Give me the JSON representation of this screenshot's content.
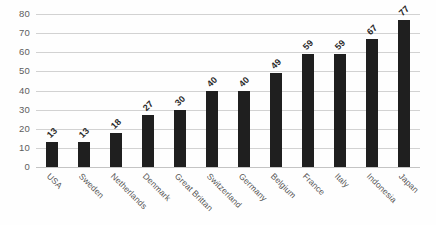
{
  "chart_data": {
    "type": "bar",
    "title": "",
    "subtitle": "",
    "xlabel": "",
    "ylabel": "",
    "ylim": [
      0,
      80
    ],
    "y_ticks": [
      0,
      10,
      20,
      30,
      40,
      50,
      60,
      70,
      80
    ],
    "grid": true,
    "legend": false,
    "legend_position": "none",
    "orientation": "vertical",
    "bar_color": "#1f1f1f",
    "gridline_color": "#d2d2d2",
    "background_color": "#fefefe",
    "data_labels_shown": true,
    "data_label_rotation": -45,
    "category_label_rotation": 45,
    "categories": [
      "USA",
      "Sweden",
      "Netherlands",
      "Denmark",
      "Great Brittan",
      "Switzerland",
      "Germany",
      "Belgium",
      "France",
      "Italy",
      "Indonesia",
      "Japan"
    ],
    "values": [
      13,
      13,
      18,
      27,
      30,
      40,
      40,
      49,
      59,
      59,
      67,
      77
    ]
  }
}
